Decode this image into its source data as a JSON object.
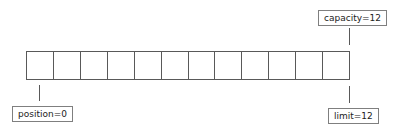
{
  "diagram": {
    "buffer": {
      "cell_count": 12,
      "cells": [
        "",
        "",
        "",
        "",
        "",
        "",
        "",
        "",
        "",
        "",
        "",
        ""
      ]
    },
    "labels": {
      "capacity": "capacity=12",
      "limit": "limit=12",
      "position": "position=0"
    },
    "colors": {
      "line": "#595959",
      "label_border": "#7f7f7f"
    }
  }
}
